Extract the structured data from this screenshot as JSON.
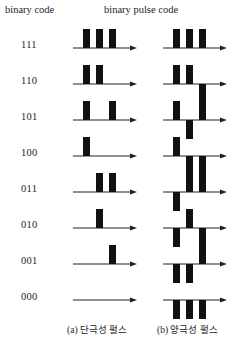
{
  "figure": {
    "headers": {
      "binary_code": "binary code",
      "binary_pulse_code": "binary pulse code"
    },
    "captions": {
      "a": "(a) 단극성 펄스",
      "b": "(b) 양극성 펄스"
    },
    "colors": {
      "pulse": "#111111",
      "axis": "#222222",
      "text": "#242424",
      "background": "#ffffff"
    },
    "encoding": {
      "unipolar": {
        "bit_1": "positive pulse above baseline",
        "bit_0": "no pulse"
      },
      "bipolar": {
        "bit_1": "positive pulse above baseline",
        "bit_0": "negative pulse below baseline"
      }
    },
    "rows": [
      {
        "code": "111",
        "bits": [
          1,
          1,
          1
        ],
        "unipolar": [
          "up",
          "up",
          "up"
        ],
        "bipolar": [
          "up",
          "up",
          "up"
        ]
      },
      {
        "code": "110",
        "bits": [
          1,
          1,
          0
        ],
        "unipolar": [
          "up",
          "up",
          "none"
        ],
        "bipolar": [
          "up",
          "up",
          "down"
        ]
      },
      {
        "code": "101",
        "bits": [
          1,
          0,
          1
        ],
        "unipolar": [
          "up",
          "none",
          "up"
        ],
        "bipolar": [
          "up",
          "down",
          "up"
        ]
      },
      {
        "code": "100",
        "bits": [
          1,
          0,
          0
        ],
        "unipolar": [
          "up",
          "none",
          "none"
        ],
        "bipolar": [
          "up",
          "down",
          "down"
        ]
      },
      {
        "code": "011",
        "bits": [
          0,
          1,
          1
        ],
        "unipolar": [
          "none",
          "up",
          "up"
        ],
        "bipolar": [
          "down",
          "up",
          "up"
        ]
      },
      {
        "code": "010",
        "bits": [
          0,
          1,
          0
        ],
        "unipolar": [
          "none",
          "up",
          "none"
        ],
        "bipolar": [
          "down",
          "up",
          "down"
        ]
      },
      {
        "code": "001",
        "bits": [
          0,
          0,
          1
        ],
        "unipolar": [
          "none",
          "none",
          "up"
        ],
        "bipolar": [
          "down",
          "down",
          "up"
        ]
      },
      {
        "code": "000",
        "bits": [
          0,
          0,
          0
        ],
        "unipolar": [
          "none",
          "none",
          "none"
        ],
        "bipolar": [
          "down",
          "down",
          "down"
        ]
      }
    ]
  },
  "chart_data": {
    "type": "line",
    "title": "binary pulse code",
    "xlabel": "",
    "ylabel": "",
    "categories": [
      "111",
      "110",
      "101",
      "100",
      "011",
      "010",
      "001",
      "000"
    ],
    "series": [
      {
        "name": "(a) 단극성 펄스",
        "values": [
          [
            1,
            1,
            1
          ],
          [
            1,
            1,
            0
          ],
          [
            1,
            0,
            1
          ],
          [
            1,
            0,
            0
          ],
          [
            0,
            1,
            1
          ],
          [
            0,
            1,
            0
          ],
          [
            0,
            0,
            1
          ],
          [
            0,
            0,
            0
          ]
        ]
      },
      {
        "name": "(b) 양극성 펄스",
        "values": [
          [
            1,
            1,
            1
          ],
          [
            1,
            1,
            -1
          ],
          [
            1,
            -1,
            1
          ],
          [
            1,
            -1,
            -1
          ],
          [
            -1,
            1,
            1
          ],
          [
            -1,
            1,
            -1
          ],
          [
            -1,
            -1,
            1
          ],
          [
            -1,
            -1,
            -1
          ]
        ]
      }
    ],
    "ylim": [
      -1,
      1
    ],
    "grid": false,
    "legend": "bottom"
  }
}
